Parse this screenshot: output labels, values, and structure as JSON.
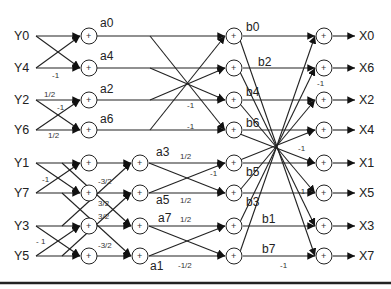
{
  "inputs": [
    "Y0",
    "Y4",
    "Y2",
    "Y6",
    "Y1",
    "Y7",
    "Y3",
    "Y5"
  ],
  "outputs": [
    "X0",
    "X6",
    "X2",
    "X4",
    "X1",
    "X5",
    "X3",
    "X7"
  ],
  "stage_a_labels": {
    "a0": "a0",
    "a4": "a4",
    "a2": "a2",
    "a6": "a6",
    "a3": "a3",
    "a5": "a5",
    "a7": "a7",
    "a1": "a1"
  },
  "stage_b_labels": {
    "b0": "b0",
    "b2": "b2",
    "b4": "b4",
    "b6": "b6",
    "b5": "b5",
    "b3": "b3",
    "b1": "b1",
    "b7": "b7"
  },
  "adder_symbol": "+",
  "weights": {
    "y4_neg": "-1",
    "y2_half": "1/2",
    "y2_neg": "-1",
    "y6_half": "1/2",
    "y1_neg": "-1",
    "y3_neg": "- 1",
    "m32_top": "-3/2",
    "p32_a": "3/2",
    "p32_b": "3/2",
    "m32_bot": "-3/2",
    "a3_half": "1/2",
    "a5_neg": "-1",
    "a5_half": "1/2",
    "a7_half": "1/2",
    "a1_neghalf": "-1/2",
    "s3_neg_a": "-1",
    "s3_neg_b": "-1",
    "s4_neg_x6": "-1",
    "s4_neg_x4": "-1",
    "s4_neg_x5": "-1",
    "s4_neg_x7": "-1"
  }
}
